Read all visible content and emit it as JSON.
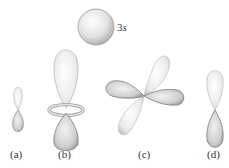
{
  "figure": {
    "sphere_label": {
      "number": "3",
      "subshell": "s"
    },
    "panels": [
      {
        "id": "a",
        "label": "(a)",
        "shape": "p-orbital-small"
      },
      {
        "id": "b",
        "label": "(b)",
        "shape": "dz2-orbital"
      },
      {
        "id": "c",
        "label": "(c)",
        "shape": "d-cloverleaf-orbital"
      },
      {
        "id": "d",
        "label": "(d)",
        "shape": "p-orbital"
      }
    ],
    "colors": {
      "light_lobe": "#efefef",
      "dark_lobe": "#c8c8c8",
      "outline": "#8a8a8a",
      "label": "#333333"
    }
  }
}
